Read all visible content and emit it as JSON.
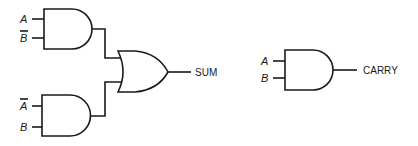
{
  "diagram": {
    "sum_circuit": {
      "gate_top": {
        "type": "AND",
        "inputs": [
          "A",
          "B"
        ],
        "input_inverted": [
          false,
          true
        ]
      },
      "gate_bottom": {
        "type": "AND",
        "inputs": [
          "A",
          "B"
        ],
        "input_inverted": [
          true,
          false
        ]
      },
      "gate_or": {
        "type": "OR"
      },
      "output_label": "SUM"
    },
    "carry_circuit": {
      "gate": {
        "type": "AND",
        "inputs": [
          "A",
          "B"
        ],
        "input_inverted": [
          false,
          false
        ]
      },
      "output_label": "CARRY"
    },
    "colors": {
      "line": "#1a1a1a",
      "background": "#ffffff"
    }
  }
}
